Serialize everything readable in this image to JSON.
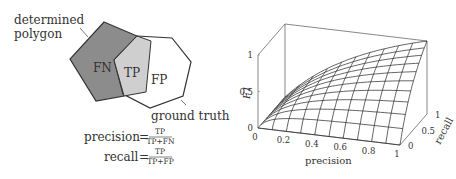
{
  "diagram": {
    "label_determined_line1": "determined",
    "label_determined_line2": "polygon",
    "label_ground_truth": "ground truth",
    "region_fn": "FN",
    "region_tp": "TP",
    "region_fp": "FP",
    "colors": {
      "fn_fill": "#8c8c8c",
      "tp_fill": "#cfcfcf",
      "fp_fill": "#ffffff",
      "stroke": "#333333"
    },
    "formulas": {
      "precision_lhs": "precision",
      "precision_num": "TP",
      "precision_den": "TP+FN",
      "recall_lhs": "recall",
      "recall_num": "TP",
      "recall_den": "TP+FP",
      "equals": "="
    }
  },
  "chart_data": {
    "type": "surface3d",
    "title": "",
    "function": "F1 = 2*precision*recall/(precision+recall)",
    "xlabel": "precision",
    "ylabel": "recall",
    "zlabel": "F1",
    "xlim": [
      0,
      1
    ],
    "ylim": [
      0,
      1
    ],
    "zlim": [
      0,
      1
    ],
    "x_ticks": [
      "0",
      "0.2",
      "0.4",
      "0.6",
      "0.8",
      "1"
    ],
    "y_ticks": [
      "0",
      "0.5",
      "1"
    ],
    "z_ticks": [
      "0",
      "0.5",
      "1"
    ],
    "grid_resolution": 10,
    "mesh": true,
    "x": [
      0,
      0.1,
      0.2,
      0.3,
      0.4,
      0.5,
      0.6,
      0.7,
      0.8,
      0.9,
      1.0
    ],
    "y": [
      0,
      0.1,
      0.2,
      0.3,
      0.4,
      0.5,
      0.6,
      0.7,
      0.8,
      0.9,
      1.0
    ],
    "sample_values": [
      {
        "precision": 0,
        "recall": 0,
        "F1": 0
      },
      {
        "precision": 0.5,
        "recall": 0.5,
        "F1": 0.5
      },
      {
        "precision": 1,
        "recall": 1,
        "F1": 1
      },
      {
        "precision": 1,
        "recall": 0.5,
        "F1": 0.667
      },
      {
        "precision": 0.5,
        "recall": 1,
        "F1": 0.667
      }
    ]
  }
}
